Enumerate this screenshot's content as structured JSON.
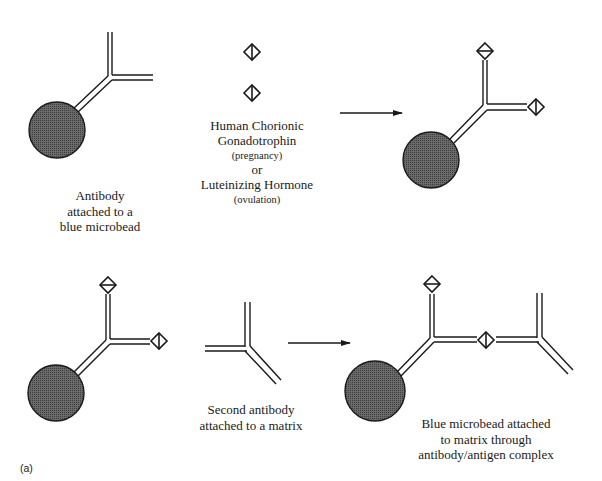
{
  "figure": {
    "panel_label": "(a)",
    "colors": {
      "line": "#1a1a1a",
      "bead_fill": "#5a5a5a",
      "background": "#ffffff"
    }
  },
  "top_row": {
    "antibody_bead": {
      "caption_lines": [
        "Antibody",
        "attached to a",
        "blue microbead"
      ]
    },
    "antigen": {
      "icon": "diamond-antigen-icon",
      "count": 2,
      "caption": {
        "line1": "Human Chorionic",
        "line2": "Gonadotrophin",
        "line3": "(pregnancy)",
        "line4": "or",
        "line5": "Luteinizing Hormone",
        "line6": "(ovulation)"
      }
    },
    "arrow": "right-arrow-icon",
    "result": "antibody-bead-with-bound-antigens"
  },
  "bottom_row": {
    "bead_complex": "antibody-bead-with-bound-antigens",
    "second_antibody": {
      "caption_lines": [
        "Second antibody",
        "attached to a matrix"
      ]
    },
    "arrow": "right-arrow-icon",
    "result": {
      "caption_lines": [
        "Blue microbead attached",
        "to matrix through",
        "antibody/antigen complex"
      ]
    }
  }
}
